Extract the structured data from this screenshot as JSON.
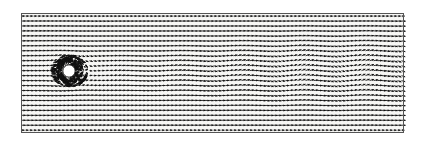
{
  "figure": {
    "caption": "",
    "background_color": "#f7f7f5",
    "paper_color": "#ffffff",
    "ink_color": "#111111",
    "border_color": "#555555"
  },
  "domain": {
    "x": 21,
    "y": 13,
    "width": 382,
    "height": 119,
    "border_width": 1,
    "label": "computational-domain"
  },
  "chart_data": {
    "type": "quiver",
    "subtitle": "",
    "xlabel": "",
    "ylabel": "",
    "grid": false,
    "legend": "none",
    "xlim": [
      0,
      1
    ],
    "ylim": [
      0,
      1
    ],
    "glyph": "arrow",
    "arrow_color": "#111111",
    "arrow_head_style": "filled-triangle",
    "grid_cols": 96,
    "grid_rows": 24,
    "col_spacing_px": 4.0,
    "row_spacing_px": 4.96,
    "arrow_length_px": 3.4,
    "arrow_head_px": 1.5,
    "inlet_velocity": 1.0,
    "freestream_direction_deg": 0,
    "obstacle": {
      "shape": "circle",
      "name": "cylinder",
      "center_x_px": 69,
      "center_y_px": 71,
      "radius_px": 6.2,
      "fill": "#ffffff",
      "edge": "#000000",
      "halo_radius_px": 19,
      "halo_fill": "#0a0a0a"
    },
    "wake": {
      "street_type": "von-karman",
      "wavelength_px": 62,
      "onset_x_px": 95,
      "amplitude_start_px": 1.5,
      "amplitude_max_px": 9.5,
      "amplitude_saturation_x_px": 300,
      "centerline_y_px": 71,
      "half_width_px": 30,
      "phase_deg": 0,
      "deficit_min_fraction": 0.18
    },
    "series": [
      {
        "name": "velocity-vectors",
        "n_vectors": 2304,
        "u_min": 0.0,
        "u_max": 1.25,
        "v_min": -0.42,
        "v_max": 0.42
      }
    ],
    "annotations": []
  }
}
